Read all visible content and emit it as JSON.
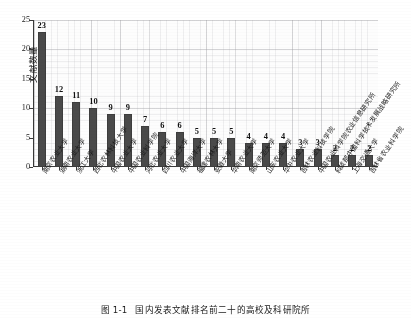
{
  "chart_data": {
    "type": "bar",
    "title": "",
    "xlabel": "",
    "ylabel": "文献数量",
    "ylim": [
      0,
      25
    ],
    "yticks": [
      0,
      5,
      10,
      15,
      20,
      25
    ],
    "grid": true,
    "legend": "none",
    "categories": [
      "南京农业大学",
      "湖南农业大学",
      "浙江大学",
      "西北农林科技大学",
      "中国农业大学",
      "中国农业科学院",
      "河北农业大学",
      "四川农业大学",
      "中国海洋大学",
      "福建农林大学",
      "安徽大学",
      "华南农业大学",
      "南京师范大学",
      "山东农业大学",
      "华中农业大学",
      "吉林农业科技学院",
      "中国农业科学院农业信息研究所",
      "科技部中国科学技术发展战略研究所",
      "上海交通大学",
      "吉林省农业科学院"
    ],
    "values": [
      23,
      12,
      11,
      10,
      9,
      9,
      7,
      6,
      6,
      5,
      5,
      5,
      4,
      4,
      4,
      3,
      3,
      2,
      2,
      2
    ]
  },
  "caption": {
    "number": "图 1-1",
    "text": "国内发表文献排名前二十的高校及科研院所"
  },
  "colors": {
    "bar": "#4a4a4a",
    "axis": "#3a3a3a",
    "grid": "#9b9ba0",
    "text": "#1a1a1a",
    "background": "#ffffff"
  }
}
